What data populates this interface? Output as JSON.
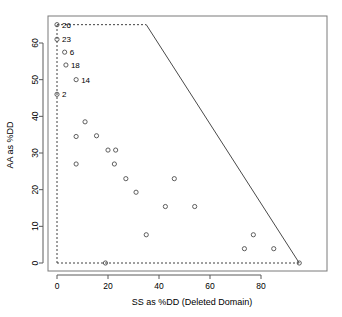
{
  "chart_data": {
    "type": "scatter",
    "title": "",
    "xlabel": "SS as %DD (Deleted Domain)",
    "ylabel": "AA as %DD",
    "xlim": [
      -3,
      99
    ],
    "ylim": [
      -3,
      68
    ],
    "xticks": [
      0,
      20,
      40,
      60,
      80
    ],
    "yticks": [
      0,
      10,
      20,
      30,
      40,
      50,
      60
    ],
    "grid": false,
    "legend": "none",
    "marker_style": "open-circle",
    "points": [
      {
        "x": 0,
        "y": 65,
        "label": "26"
      },
      {
        "x": 0,
        "y": 61,
        "label": "23"
      },
      {
        "x": 3,
        "y": 57.5,
        "label": "6"
      },
      {
        "x": 3.5,
        "y": 54,
        "label": "18"
      },
      {
        "x": 7.5,
        "y": 50,
        "label": "14"
      },
      {
        "x": 0,
        "y": 46,
        "label": "2"
      },
      {
        "x": 11,
        "y": 38.5,
        "label": ""
      },
      {
        "x": 7.5,
        "y": 34.5,
        "label": ""
      },
      {
        "x": 15.5,
        "y": 34.7,
        "label": ""
      },
      {
        "x": 20,
        "y": 30.8,
        "label": ""
      },
      {
        "x": 23,
        "y": 30.8,
        "label": ""
      },
      {
        "x": 7.5,
        "y": 27,
        "label": ""
      },
      {
        "x": 22.5,
        "y": 27,
        "label": ""
      },
      {
        "x": 27,
        "y": 23,
        "label": ""
      },
      {
        "x": 46,
        "y": 23,
        "label": ""
      },
      {
        "x": 31,
        "y": 19.3,
        "label": ""
      },
      {
        "x": 42.5,
        "y": 15.4,
        "label": ""
      },
      {
        "x": 54,
        "y": 15.4,
        "label": ""
      },
      {
        "x": 35,
        "y": 7.7,
        "label": ""
      },
      {
        "x": 77,
        "y": 7.7,
        "label": ""
      },
      {
        "x": 73.5,
        "y": 3.9,
        "label": ""
      },
      {
        "x": 85,
        "y": 3.9,
        "label": ""
      },
      {
        "x": 19,
        "y": 0,
        "label": ""
      },
      {
        "x": 95,
        "y": 0,
        "label": ""
      }
    ],
    "boundary_dashed": {
      "description": "dashed feasible-region outline",
      "segments": [
        {
          "from": [
            0,
            0
          ],
          "to": [
            0,
            65
          ]
        },
        {
          "from": [
            0,
            65
          ],
          "to": [
            35,
            65
          ]
        },
        {
          "from": [
            0,
            0
          ],
          "to": [
            95,
            0
          ]
        }
      ]
    },
    "boundary_solid": {
      "description": "solid constraint frontier",
      "segments": [
        {
          "from": [
            35,
            65
          ],
          "to": [
            95,
            0
          ]
        }
      ]
    },
    "colors": {
      "marker": "#4d4d4d",
      "frame": "#7a7a7a",
      "dashed": "#2b2b2b",
      "solid": "#4a4a4a",
      "text": "#000000",
      "background": "#ffffff"
    }
  }
}
